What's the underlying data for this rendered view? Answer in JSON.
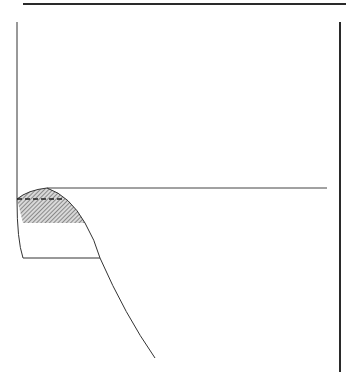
{
  "diagram": {
    "type": "technical-line-drawing",
    "stroke_color": "#333333",
    "frame_color": "#2a2a2a",
    "hatch_color": "#555555",
    "background": "#ffffff",
    "elements": {
      "top_border": {
        "x1": 23,
        "y1": 4,
        "x2": 346,
        "y2": 4,
        "width": 2.2
      },
      "right_border": {
        "x1": 340,
        "y1": 22,
        "x2": 340,
        "y2": 372,
        "width": 2
      },
      "left_wall": {
        "d": "M17 22 L17 200 Q17 240 23 258 L100 258"
      },
      "horizontal_line": {
        "x1": 47,
        "y1": 188,
        "x2": 327,
        "y2": 188
      },
      "profile_curve": {
        "d": "M17 199 Q28 190 47 188 Q70 196 85 223 Q95 240 100 258 Q125 315 155 358"
      },
      "hatched_region": {
        "d": "M17 199 Q28 190 47 188 Q70 196 85 223 L23 223 Z"
      },
      "dashed_line": {
        "x1": 17,
        "y1": 199,
        "x2": 65,
        "y2": 199
      }
    }
  }
}
